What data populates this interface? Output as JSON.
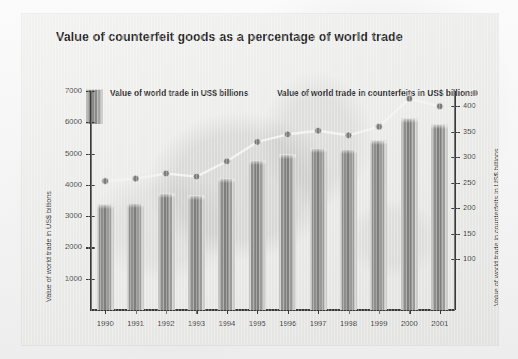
{
  "chart_data": {
    "type": "bar",
    "title": "Value of counterfeit goods as a percentage of world trade",
    "categories": [
      "1990",
      "1991",
      "1992",
      "1993",
      "1994",
      "1995",
      "1996",
      "1997",
      "1998",
      "1999",
      "2000",
      "2001"
    ],
    "series": [
      {
        "name": "Value of world trade in US$ billions",
        "type": "bar",
        "axis": "left",
        "values": [
          3350,
          3400,
          3700,
          3650,
          4200,
          4750,
          4950,
          5150,
          5100,
          5400,
          6100,
          5900
        ]
      },
      {
        "name": "Value of world trade in counterfeits in US$ billions",
        "type": "line",
        "axis": "right",
        "values": [
          253,
          258,
          268,
          262,
          292,
          330,
          345,
          352,
          343,
          360,
          415,
          400
        ]
      }
    ],
    "xlabel": "",
    "ylabel": "Value of world trade in US$ billions",
    "ylabel_right": "Value of world trade in counterfeits in US$ billions",
    "ylim": [
      0,
      7000
    ],
    "ylim_right": [
      0,
      430
    ],
    "yticks": [
      1000,
      2000,
      3000,
      4000,
      5000,
      6000,
      7000
    ],
    "yticks_right": [
      100,
      150,
      200,
      250,
      300,
      350,
      400
    ],
    "grid": false,
    "legend_position": "top"
  },
  "legend": {
    "bar_label": "Value of world trade in US$ billions",
    "line_label": "Value of world trade in counterfeits in US$ billions"
  },
  "colors": {
    "bar": "#8e8e8c",
    "line": "#f2f2f0",
    "marker": "#7d7d7b",
    "axis": "#3a3a3a",
    "panel_background": "#ececeb",
    "text": "#2b2b2b"
  }
}
